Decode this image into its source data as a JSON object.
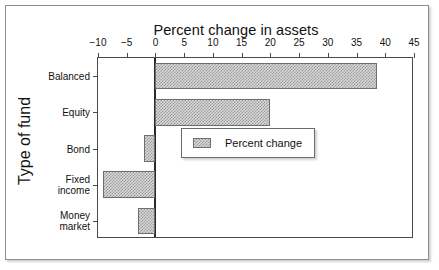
{
  "chart_data": {
    "type": "bar",
    "orientation": "horizontal",
    "title": "Percent change in assets",
    "xlabel": "Percent change in assets",
    "ylabel": "Type of fund",
    "categories": [
      "Balanced",
      "Equity",
      "Bond",
      "Fixed\nincome",
      "Money\nmarket"
    ],
    "values": [
      38.5,
      20,
      -2,
      -9.2,
      -3
    ],
    "series": [
      {
        "name": "Percent change",
        "values": [
          38.5,
          20,
          -2,
          -9.2,
          -3
        ]
      }
    ],
    "xlim": [
      -10,
      45
    ],
    "xticks": [
      -10,
      -5,
      0,
      5,
      10,
      15,
      20,
      25,
      30,
      35,
      40,
      45
    ],
    "xtick_labels": [
      "−10",
      "−5",
      "0",
      "5",
      "10",
      "15",
      "20",
      "25",
      "30",
      "35",
      "40",
      "45"
    ],
    "grid": false,
    "legend_position": "lower-right",
    "legend_entries": [
      "Percent change"
    ],
    "zero_line": 0,
    "colors": {
      "bar_fill": "#d8d8d8",
      "bar_hatch": "#9a9a9a",
      "bar_border": "#6e6e6e",
      "axis": "#4a4a4a",
      "zero_line": "#2b2b2b",
      "text": "#111111",
      "frame": "#8d8d8d",
      "background": "#ffffff"
    }
  }
}
